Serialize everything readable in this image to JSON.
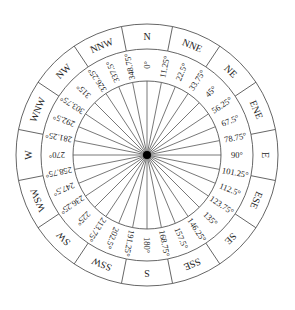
{
  "diagram": {
    "type": "compass-rose",
    "center": {
      "x": 147,
      "y": 155
    },
    "radii": {
      "outer": 131,
      "middle": 106,
      "inner": 74,
      "hub": 4
    },
    "colors": {
      "line": "#555555",
      "text": "#222222",
      "hub": "#000000",
      "background": "#ffffff"
    },
    "directions": [
      {
        "label": "N",
        "angle": 0
      },
      {
        "label": "NNE",
        "angle": 22.5
      },
      {
        "label": "NE",
        "angle": 45
      },
      {
        "label": "ENE",
        "angle": 67.5
      },
      {
        "label": "E",
        "angle": 90
      },
      {
        "label": "ESE",
        "angle": 112.5
      },
      {
        "label": "SE",
        "angle": 135
      },
      {
        "label": "SSE",
        "angle": 157.5
      },
      {
        "label": "S",
        "angle": 180
      },
      {
        "label": "SSW",
        "angle": 202.5
      },
      {
        "label": "SW",
        "angle": 225
      },
      {
        "label": "WSW",
        "angle": 247.5
      },
      {
        "label": "W",
        "angle": 270
      },
      {
        "label": "WNW",
        "angle": 292.5
      },
      {
        "label": "NW",
        "angle": 315
      },
      {
        "label": "NNW",
        "angle": 337.5
      }
    ],
    "degrees": [
      {
        "label": "0°",
        "angle": 0
      },
      {
        "label": "11.25°",
        "angle": 11.25
      },
      {
        "label": "22.5°",
        "angle": 22.5
      },
      {
        "label": "33.75°",
        "angle": 33.75
      },
      {
        "label": "45°",
        "angle": 45
      },
      {
        "label": "56.25°",
        "angle": 56.25
      },
      {
        "label": "67.5°",
        "angle": 67.5
      },
      {
        "label": "78.75°",
        "angle": 78.75
      },
      {
        "label": "90°",
        "angle": 90
      },
      {
        "label": "101.25°",
        "angle": 101.25
      },
      {
        "label": "112.5°",
        "angle": 112.5
      },
      {
        "label": "123.75°",
        "angle": 123.75
      },
      {
        "label": "135°",
        "angle": 135
      },
      {
        "label": "146.25°",
        "angle": 146.25
      },
      {
        "label": "157.5°",
        "angle": 157.5
      },
      {
        "label": "168.75°",
        "angle": 168.75
      },
      {
        "label": "180°",
        "angle": 180
      },
      {
        "label": "191.25°",
        "angle": 191.25
      },
      {
        "label": "202.5°",
        "angle": 202.5
      },
      {
        "label": "213.75°",
        "angle": 213.75
      },
      {
        "label": "225°",
        "angle": 225
      },
      {
        "label": "236.25°",
        "angle": 236.25
      },
      {
        "label": "247.5°",
        "angle": 247.5
      },
      {
        "label": "258.75°",
        "angle": 258.75
      },
      {
        "label": "270°",
        "angle": 270
      },
      {
        "label": "281.25°",
        "angle": 281.25
      },
      {
        "label": "292.5°",
        "angle": 292.5
      },
      {
        "label": "303.75°",
        "angle": 303.75
      },
      {
        "label": "315°",
        "angle": 315
      },
      {
        "label": "326.25°",
        "angle": 326.25
      },
      {
        "label": "337.5°",
        "angle": 337.5
      },
      {
        "label": "348.75°",
        "angle": 348.75
      }
    ]
  }
}
